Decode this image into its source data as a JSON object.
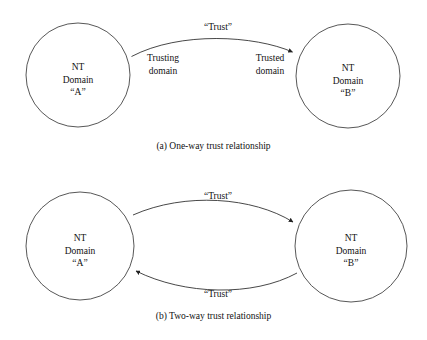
{
  "figure": {
    "background_color": "#ffffff",
    "stroke_color": "#222222"
  },
  "panels": [
    {
      "id": "a",
      "caption": "(a) One-way trust relationship",
      "nodes": [
        {
          "id": "a-top",
          "lines": [
            "NT",
            "Domain",
            "“A”"
          ],
          "cx": 78,
          "cy": 75,
          "r": 52
        },
        {
          "id": "b-top",
          "lines": [
            "NT",
            "Domain",
            "“B”"
          ],
          "cx": 348,
          "cy": 76,
          "r": 52
        }
      ],
      "edges": [
        {
          "id": "trust-a",
          "label": "“Trust”",
          "from": "a-top",
          "to": "b-top",
          "direction": "one-way",
          "arrow": "end"
        }
      ],
      "annotations": [
        {
          "id": "trusting",
          "lines": [
            "Trusting",
            "domain"
          ]
        },
        {
          "id": "trusted",
          "lines": [
            "Trusted",
            "domain"
          ]
        }
      ]
    },
    {
      "id": "b",
      "caption": "(b) Two-way trust relationship",
      "nodes": [
        {
          "id": "a-bot",
          "lines": [
            "NT",
            "Domain",
            "“A”"
          ],
          "cx": 80,
          "cy": 246,
          "r": 54
        },
        {
          "id": "b-bot",
          "lines": [
            "NT",
            "Domain",
            "“B”"
          ],
          "cx": 351,
          "cy": 246,
          "r": 56
        }
      ],
      "edges": [
        {
          "id": "trust-b-upper",
          "label": "“Trust”",
          "from": "a-bot",
          "to": "b-bot",
          "direction": "a-to-b",
          "arrow": "end"
        },
        {
          "id": "trust-b-lower",
          "label": "“Trust”",
          "from": "b-bot",
          "to": "a-bot",
          "direction": "b-to-a",
          "arrow": "end"
        }
      ],
      "annotations": []
    }
  ]
}
